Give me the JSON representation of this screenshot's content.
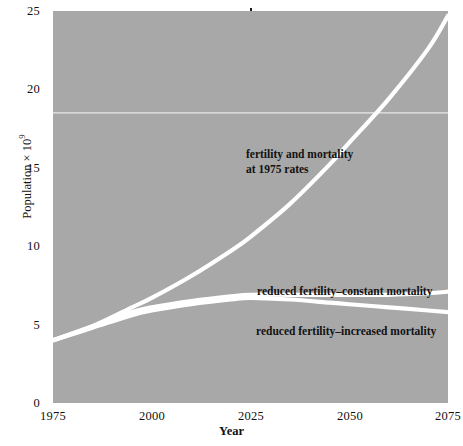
{
  "chart_data": {
    "type": "line",
    "title": "",
    "xlabel": "Year",
    "ylabel": "Population × 10⁹",
    "ylabel_base": "Population × 10",
    "ylabel_exponent": "9",
    "xlim": [
      1975,
      2075
    ],
    "ylim": [
      0,
      25
    ],
    "xticks": [
      1975,
      2000,
      2025,
      2050,
      2075
    ],
    "yticks": [
      0,
      5,
      10,
      15,
      20,
      25
    ],
    "xtick_labels": [
      "1975",
      "2000",
      "2025",
      "2050",
      "2075"
    ],
    "ytick_labels": [
      "0",
      "5",
      "10",
      "15",
      "20",
      "25"
    ],
    "grid": "single horizontal reference line at y = 18.5",
    "gridlines_y": [
      18.5
    ],
    "legend_position": "inline annotations on plot",
    "plot_background": "#a8a8a8",
    "line_color": "#ffffff",
    "series": [
      {
        "name": "fertility and mortality at 1975 rates",
        "annotation": "fertility and mortality\nat 1975 rates",
        "annotation_line_1": "fertility and mortality",
        "annotation_line_2": "at 1975 rates",
        "x": [
          1975,
          1985,
          1995,
          2000,
          2010,
          2020,
          2025,
          2035,
          2045,
          2050,
          2060,
          2070,
          2075
        ],
        "values": [
          4.0,
          4.9,
          6.1,
          6.7,
          8.1,
          9.7,
          10.6,
          12.7,
          15.2,
          16.6,
          19.4,
          22.6,
          24.7
        ]
      },
      {
        "name": "reduced fertility–constant mortality",
        "annotation": "reduced fertility–constant mortality",
        "x": [
          1975,
          1985,
          1995,
          2000,
          2010,
          2020,
          2025,
          2035,
          2045,
          2050,
          2060,
          2070,
          2075
        ],
        "values": [
          4.0,
          4.9,
          5.8,
          6.1,
          6.5,
          6.8,
          6.9,
          6.9,
          6.9,
          6.9,
          6.9,
          7.0,
          7.1
        ]
      },
      {
        "name": "reduced fertility–increased mortality",
        "annotation": "reduced fertility–increased mortality",
        "x": [
          1975,
          1985,
          1995,
          2000,
          2010,
          2020,
          2025,
          2035,
          2045,
          2050,
          2060,
          2070,
          2075
        ],
        "values": [
          4.0,
          4.8,
          5.6,
          5.9,
          6.3,
          6.6,
          6.7,
          6.6,
          6.4,
          6.3,
          6.1,
          5.9,
          5.8
        ]
      }
    ]
  }
}
